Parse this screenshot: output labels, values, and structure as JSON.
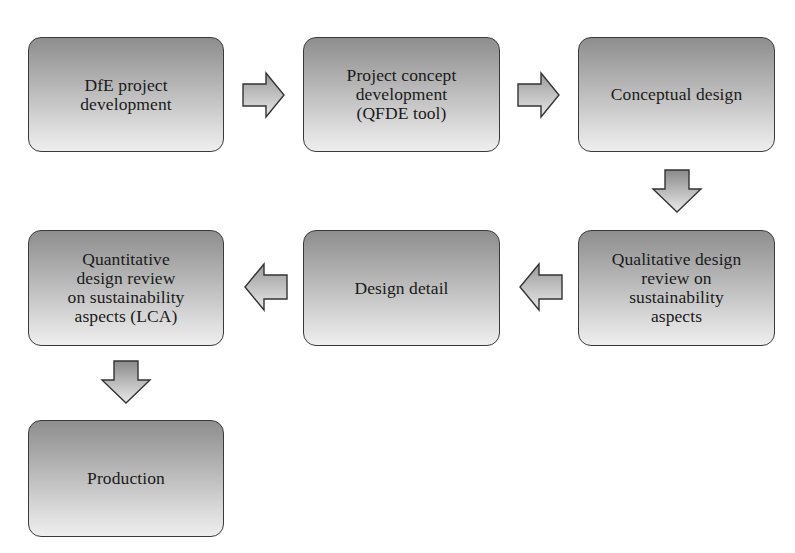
{
  "diagram": {
    "type": "process-flowchart",
    "boxes": [
      {
        "id": "dfe-project-development",
        "label": "DfE project\ndevelopment"
      },
      {
        "id": "project-concept-development",
        "label": "Project concept\ndevelopment\n(QFDE tool)"
      },
      {
        "id": "conceptual-design",
        "label": "Conceptual design"
      },
      {
        "id": "qualitative-design-review",
        "label": "Qualitative design\nreview on\nsustainability\naspects"
      },
      {
        "id": "design-detail",
        "label": "Design detail"
      },
      {
        "id": "quantitative-design-review",
        "label": "Quantitative\ndesign review\non sustainability\naspects (LCA)"
      },
      {
        "id": "production",
        "label": "Production"
      }
    ],
    "edges": [
      {
        "from": "dfe-project-development",
        "to": "project-concept-development",
        "direction": "right"
      },
      {
        "from": "project-concept-development",
        "to": "conceptual-design",
        "direction": "right"
      },
      {
        "from": "conceptual-design",
        "to": "qualitative-design-review",
        "direction": "down"
      },
      {
        "from": "qualitative-design-review",
        "to": "design-detail",
        "direction": "left"
      },
      {
        "from": "design-detail",
        "to": "quantitative-design-review",
        "direction": "left"
      },
      {
        "from": "quantitative-design-review",
        "to": "production",
        "direction": "down"
      }
    ],
    "colors": {
      "box_gradient_top": "#8e8e8e",
      "box_gradient_bottom": "#eeeeee",
      "border": "#3a3a3a",
      "text": "#1a1a1a"
    }
  }
}
